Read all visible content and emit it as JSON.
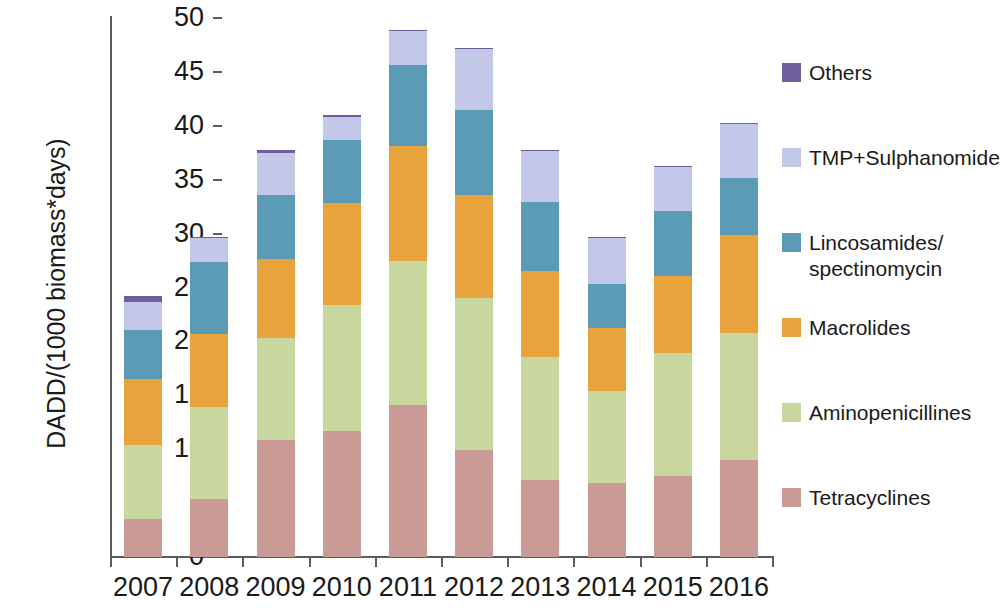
{
  "chart_data": {
    "type": "bar",
    "stacked": true,
    "title": "",
    "xlabel": "",
    "ylabel": "DADD/(1000 biomass*days)",
    "ylim": [
      0,
      50
    ],
    "ytick_step": 5,
    "yticks": [
      50,
      45,
      40,
      35,
      30,
      25,
      20,
      15,
      10,
      5,
      0
    ],
    "grid": false,
    "legend_position": "right",
    "categories": [
      "2007",
      "2008",
      "2009",
      "2010",
      "2011",
      "2012",
      "2013",
      "2014",
      "2015",
      "2016"
    ],
    "series": [
      {
        "name": "Tetracyclines",
        "color": "#c99a96",
        "values": [
          3.5,
          5.4,
          10.9,
          11.7,
          14.1,
          9.9,
          7.1,
          6.9,
          7.5,
          9.0
        ]
      },
      {
        "name": "Aminopenicillines",
        "color": "#c8d79e",
        "values": [
          6.9,
          8.5,
          9.4,
          11.7,
          13.4,
          14.1,
          11.5,
          8.5,
          11.4,
          11.8
        ]
      },
      {
        "name": "Macrolides",
        "color": "#e8a33d",
        "values": [
          6.1,
          6.8,
          7.3,
          9.4,
          10.6,
          9.6,
          7.9,
          5.8,
          7.2,
          9.1
        ]
      },
      {
        "name": "Lincosamides/spectinomycin",
        "color": "#5b9bb5",
        "values": [
          4.6,
          6.7,
          6.0,
          5.9,
          7.5,
          7.9,
          6.4,
          4.1,
          6.0,
          5.3
        ]
      },
      {
        "name": "TMP+Sulphanomide",
        "color": "#c3c7e8",
        "values": [
          2.6,
          2.2,
          3.9,
          2.1,
          3.2,
          5.6,
          4.8,
          4.3,
          4.1,
          5.0
        ]
      },
      {
        "name": "Others",
        "color": "#6f5e9c",
        "values": [
          0.5,
          0.1,
          0.3,
          0.2,
          0.1,
          0.1,
          0.1,
          0.1,
          0.1,
          0.1
        ]
      }
    ],
    "totals": [
      24.2,
      29.7,
      37.8,
      41.0,
      48.9,
      47.2,
      37.8,
      29.7,
      36.3,
      40.3
    ]
  },
  "legend": {
    "items": [
      {
        "label": "Others",
        "color": "#6f5e9c",
        "top": 0
      },
      {
        "label": "TMP+Sulphanomide",
        "color": "#c3c7e8",
        "top": 85
      },
      {
        "label": "Lincosamides/\nspectinomycin",
        "color": "#5b9bb5",
        "top": 170
      },
      {
        "label": "Macrolides",
        "color": "#e8a33d",
        "top": 255
      },
      {
        "label": "Aminopenicillines",
        "color": "#c8d79e",
        "top": 340
      },
      {
        "label": "Tetracyclines",
        "color": "#c99a96",
        "top": 425
      }
    ]
  }
}
